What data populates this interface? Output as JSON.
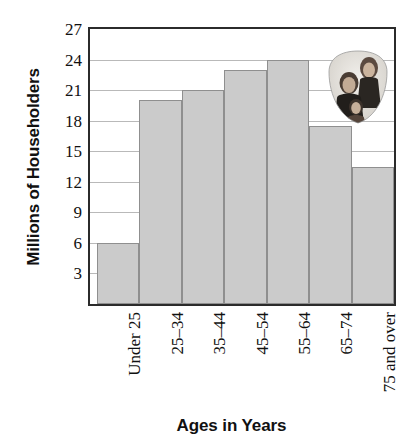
{
  "chart_data": {
    "type": "bar",
    "title": "",
    "xlabel": "Ages in Years",
    "ylabel": "Millions of Householders",
    "categories": [
      "Under 25",
      "25–34",
      "35–44",
      "45–54",
      "55–64",
      "65–74",
      "75 and over"
    ],
    "values": [
      6,
      20,
      21,
      23,
      24,
      17.5,
      13.5
    ],
    "ylim": [
      0,
      27
    ],
    "yticks": [
      3,
      6,
      9,
      12,
      15,
      18,
      21,
      24,
      27
    ],
    "ytick_labels": [
      "3",
      "6",
      "9",
      "12",
      "15",
      "18",
      "21",
      "24",
      "27"
    ],
    "grid": true,
    "legend": "none",
    "bar_color": "#cbcbcb",
    "bar_edge_color": "#8f8f8f",
    "gridline_color": "#b9b9b9",
    "axis_color": "#2b2b2b",
    "text_color": "#111111"
  },
  "annotations": {
    "photo_inset": {
      "name": "family-photograph",
      "description": "Oval vignette photograph of a family group"
    }
  }
}
